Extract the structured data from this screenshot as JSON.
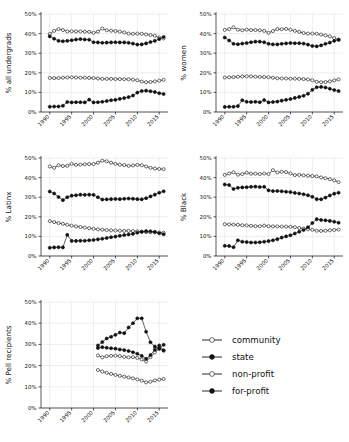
{
  "figure": {
    "background": "#ffffff",
    "series_names": [
      "community",
      "state",
      "non-profit",
      "for-profit"
    ],
    "axis_color": "#111111",
    "grid_color": "#d9d9d9"
  },
  "legend": {
    "position": "bottom-right",
    "items": [
      {
        "label": "community",
        "marker": "open-circle"
      },
      {
        "label": "state",
        "marker": "filled-circle"
      },
      {
        "label": "non-profit",
        "marker": "open-circle"
      },
      {
        "label": "for-profit",
        "marker": "filled-circle"
      }
    ]
  },
  "axes": {
    "ytick_labels": [
      "0%",
      "10%",
      "20%",
      "30%",
      "40%",
      "50%"
    ],
    "ytick_values": [
      0,
      10,
      20,
      30,
      40,
      50
    ],
    "xtick_labels": [
      "1990",
      "1995",
      "2000",
      "2005",
      "2010",
      "2015"
    ],
    "xtick_values": [
      1990,
      1995,
      2000,
      2005,
      2010,
      2015
    ],
    "ylim": [
      0,
      50
    ],
    "xlim": [
      1988,
      2017
    ]
  },
  "chart_data": [
    {
      "id": "all-undergrads",
      "type": "line",
      "title": "",
      "xlabel": "",
      "ylabel": "% all undergrads",
      "ylim": [
        0,
        50
      ],
      "xlim": [
        1988,
        2017
      ],
      "grid": true,
      "legend": "none",
      "x": [
        1990,
        1991,
        1992,
        1993,
        1994,
        1995,
        1996,
        1997,
        1998,
        1999,
        2000,
        2001,
        2002,
        2003,
        2004,
        2005,
        2006,
        2007,
        2008,
        2009,
        2010,
        2011,
        2012,
        2013,
        2014,
        2015,
        2016
      ],
      "series": [
        {
          "name": "community",
          "marker": "open-circle",
          "values": [
            39.8,
            41.4,
            42.3,
            41.8,
            41.1,
            41.2,
            41.1,
            41.1,
            41.0,
            40.9,
            40.4,
            41.0,
            42.6,
            41.7,
            41.5,
            41.3,
            41.0,
            40.6,
            40.0,
            39.9,
            40.0,
            39.9,
            39.6,
            39.3,
            38.9,
            38.0,
            37.5
          ]
        },
        {
          "name": "state",
          "marker": "filled-circle",
          "values": [
            38.6,
            37.4,
            36.3,
            36.1,
            36.3,
            36.6,
            37.0,
            37.2,
            37.0,
            36.9,
            35.6,
            35.5,
            35.3,
            35.4,
            35.5,
            35.6,
            35.5,
            35.5,
            35.3,
            34.9,
            34.4,
            34.5,
            35.0,
            35.7,
            36.3,
            37.2,
            38.3
          ]
        },
        {
          "name": "non-profit",
          "marker": "open-circle",
          "values": [
            17.4,
            17.3,
            17.3,
            17.5,
            17.6,
            17.7,
            17.6,
            17.5,
            17.5,
            17.4,
            17.3,
            17.1,
            16.9,
            16.9,
            16.9,
            16.8,
            16.8,
            16.7,
            16.7,
            16.5,
            16.2,
            15.5,
            15.2,
            15.3,
            15.6,
            16.0,
            16.4
          ]
        },
        {
          "name": "for-profit",
          "marker": "filled-circle",
          "values": [
            2.7,
            2.8,
            2.8,
            3.2,
            5.1,
            4.9,
            5.0,
            5.0,
            4.9,
            6.3,
            4.9,
            5.0,
            5.2,
            5.6,
            6.0,
            6.2,
            6.7,
            7.1,
            7.6,
            8.4,
            9.9,
            10.7,
            10.9,
            10.6,
            10.2,
            9.6,
            9.2
          ]
        }
      ]
    },
    {
      "id": "women",
      "type": "line",
      "title": "",
      "xlabel": "",
      "ylabel": "% women",
      "ylim": [
        0,
        50
      ],
      "xlim": [
        1988,
        2017
      ],
      "grid": true,
      "legend": "none",
      "x": [
        1990,
        1991,
        1992,
        1993,
        1994,
        1995,
        1996,
        1997,
        1998,
        1999,
        2000,
        2001,
        2002,
        2003,
        2004,
        2005,
        2006,
        2007,
        2008,
        2009,
        2010,
        2011,
        2012,
        2013,
        2014,
        2015,
        2016
      ],
      "series": [
        {
          "name": "community",
          "marker": "open-circle",
          "values": [
            41.9,
            42.3,
            43.2,
            42.0,
            41.7,
            42.0,
            41.8,
            41.8,
            41.7,
            41.4,
            40.4,
            41.3,
            42.3,
            42.2,
            42.4,
            42.0,
            41.4,
            40.9,
            40.3,
            40.0,
            40.0,
            39.9,
            39.5,
            39.1,
            38.6,
            37.7,
            36.9
          ]
        },
        {
          "name": "state",
          "marker": "filled-circle",
          "values": [
            38.0,
            36.5,
            34.8,
            34.6,
            34.9,
            35.2,
            35.6,
            35.9,
            35.9,
            35.6,
            34.8,
            34.5,
            34.5,
            34.8,
            35.0,
            35.2,
            35.1,
            35.1,
            34.9,
            34.4,
            33.7,
            33.5,
            34.0,
            34.8,
            35.4,
            36.3,
            36.8
          ]
        },
        {
          "name": "non-profit",
          "marker": "open-circle",
          "values": [
            17.6,
            17.7,
            17.8,
            18.0,
            18.1,
            18.2,
            18.2,
            18.0,
            17.9,
            17.8,
            17.7,
            17.5,
            17.2,
            17.1,
            17.1,
            17.0,
            17.0,
            16.9,
            16.8,
            16.6,
            16.2,
            15.4,
            15.2,
            15.3,
            15.6,
            16.1,
            16.6
          ]
        },
        {
          "name": "for-profit",
          "marker": "filled-circle",
          "values": [
            2.6,
            2.7,
            2.7,
            3.0,
            6.0,
            5.2,
            5.1,
            5.2,
            5.0,
            6.1,
            4.9,
            5.1,
            5.3,
            5.8,
            6.2,
            6.6,
            7.2,
            7.7,
            8.3,
            9.3,
            11.3,
            12.6,
            12.8,
            12.5,
            11.9,
            11.2,
            10.7
          ]
        }
      ]
    },
    {
      "id": "latinx",
      "type": "line",
      "title": "",
      "xlabel": "",
      "ylabel": "% Latinx",
      "ylim": [
        0,
        50
      ],
      "xlim": [
        1988,
        2017
      ],
      "grid": true,
      "legend": "none",
      "x": [
        1990,
        1991,
        1992,
        1993,
        1994,
        1995,
        1996,
        1997,
        1998,
        1999,
        2000,
        2001,
        2002,
        2003,
        2004,
        2005,
        2006,
        2007,
        2008,
        2009,
        2010,
        2011,
        2012,
        2013,
        2014,
        2015,
        2016
      ],
      "series": [
        {
          "name": "community",
          "marker": "open-circle",
          "values": [
            45.7,
            45.0,
            46.3,
            45.9,
            46.0,
            47.0,
            46.5,
            46.6,
            46.8,
            46.9,
            46.9,
            47.6,
            48.6,
            48.3,
            47.6,
            47.0,
            46.6,
            46.4,
            46.0,
            46.2,
            46.5,
            46.3,
            45.7,
            45.0,
            44.6,
            44.4,
            44.3
          ]
        },
        {
          "name": "state",
          "marker": "filled-circle",
          "values": [
            32.9,
            31.9,
            30.1,
            28.5,
            30.0,
            30.8,
            31.0,
            31.3,
            31.2,
            31.3,
            31.2,
            30.0,
            28.8,
            28.9,
            29.0,
            29.1,
            29.0,
            29.2,
            29.3,
            29.2,
            29.0,
            28.9,
            29.5,
            30.4,
            31.3,
            32.3,
            33.0
          ]
        },
        {
          "name": "non-profit",
          "marker": "open-circle",
          "values": [
            17.8,
            17.3,
            16.8,
            16.4,
            15.9,
            15.5,
            15.1,
            14.8,
            14.5,
            14.2,
            13.9,
            13.6,
            13.4,
            13.2,
            13.1,
            13.0,
            12.9,
            12.8,
            12.8,
            12.7,
            12.6,
            12.3,
            12.2,
            12.1,
            12.1,
            12.0,
            11.9
          ]
        },
        {
          "name": "for-profit",
          "marker": "filled-circle",
          "values": [
            4.2,
            4.4,
            4.5,
            4.4,
            10.8,
            7.7,
            7.7,
            7.8,
            7.8,
            8.0,
            8.2,
            8.5,
            8.8,
            9.2,
            9.6,
            9.9,
            10.3,
            10.7,
            11.0,
            11.3,
            11.9,
            12.4,
            12.7,
            12.6,
            12.3,
            11.6,
            11.1
          ]
        }
      ]
    },
    {
      "id": "black",
      "type": "line",
      "title": "",
      "xlabel": "",
      "ylabel": "% Black",
      "ylim": [
        0,
        50
      ],
      "xlim": [
        1988,
        2017
      ],
      "grid": true,
      "legend": "none",
      "x": [
        1990,
        1991,
        1992,
        1993,
        1994,
        1995,
        1996,
        1997,
        1998,
        1999,
        2000,
        2001,
        2002,
        2003,
        2004,
        2005,
        2006,
        2007,
        2008,
        2009,
        2010,
        2011,
        2012,
        2013,
        2014,
        2015,
        2016
      ],
      "series": [
        {
          "name": "community",
          "marker": "open-circle",
          "values": [
            41.4,
            42.1,
            42.7,
            41.5,
            41.8,
            42.5,
            42.0,
            42.0,
            41.8,
            42.1,
            41.8,
            43.8,
            42.6,
            43.0,
            42.8,
            42.1,
            41.3,
            41.4,
            41.2,
            41.0,
            40.8,
            40.6,
            40.1,
            39.7,
            39.2,
            38.6,
            37.7
          ]
        },
        {
          "name": "state",
          "marker": "filled-circle",
          "values": [
            36.5,
            36.2,
            34.2,
            34.8,
            35.0,
            35.1,
            35.3,
            35.4,
            35.2,
            35.3,
            33.5,
            33.1,
            33.2,
            33.0,
            32.8,
            32.6,
            32.2,
            31.9,
            31.5,
            31.0,
            30.2,
            29.0,
            28.9,
            29.8,
            30.9,
            31.8,
            32.3
          ]
        },
        {
          "name": "non-profit",
          "marker": "open-circle",
          "values": [
            16.2,
            16.1,
            16.0,
            15.9,
            15.7,
            15.6,
            15.4,
            15.2,
            15.2,
            15.5,
            15.2,
            15.1,
            15.1,
            15.0,
            15.0,
            14.9,
            14.7,
            14.3,
            14.0,
            13.7,
            13.4,
            12.9,
            12.8,
            12.9,
            13.1,
            13.3,
            13.5
          ]
        },
        {
          "name": "for-profit",
          "marker": "filled-circle",
          "values": [
            5.2,
            5.1,
            4.5,
            8.0,
            7.3,
            7.1,
            6.9,
            6.9,
            7.0,
            7.3,
            7.6,
            8.0,
            8.6,
            9.4,
            10.0,
            10.6,
            11.5,
            12.4,
            13.3,
            14.7,
            16.8,
            18.8,
            18.4,
            18.2,
            17.9,
            17.5,
            17.0
          ]
        }
      ]
    },
    {
      "id": "pell-recipients",
      "type": "line",
      "title": "",
      "xlabel": "",
      "ylabel": "% Pell recipients",
      "ylim": [
        0,
        50
      ],
      "xlim": [
        1988,
        2017
      ],
      "grid": true,
      "legend": "bottom-right",
      "x": [
        2001,
        2002,
        2003,
        2004,
        2005,
        2006,
        2007,
        2008,
        2009,
        2010,
        2011,
        2012,
        2013,
        2014,
        2015,
        2016
      ],
      "series": [
        {
          "name": "community",
          "marker": "open-circle",
          "values": [
            24.8,
            23.9,
            24.4,
            24.6,
            24.7,
            24.5,
            24.1,
            23.9,
            24.0,
            23.6,
            22.9,
            21.9,
            24.0,
            26.2,
            28.0,
            27.0
          ]
        },
        {
          "name": "state",
          "marker": "filled-circle",
          "values": [
            29.5,
            31.1,
            32.8,
            33.6,
            34.5,
            35.6,
            35.3,
            38.0,
            40.0,
            42.3,
            42.3,
            36.0,
            31.0,
            29.0,
            28.0,
            29.8
          ]
        },
        {
          "name": "non-profit",
          "marker": "open-circle",
          "values": [
            17.9,
            17.2,
            16.6,
            16.1,
            15.6,
            15.2,
            14.8,
            14.4,
            14.0,
            13.5,
            12.9,
            12.1,
            12.4,
            13.0,
            13.4,
            13.7
          ]
        },
        {
          "name": "for-profit",
          "marker": "filled-circle",
          "values": [
            28.3,
            28.7,
            28.4,
            28.2,
            28.0,
            27.6,
            27.3,
            26.9,
            26.3,
            25.6,
            24.6,
            23.2,
            25.0,
            27.5,
            29.5,
            27.2
          ]
        }
      ]
    }
  ]
}
